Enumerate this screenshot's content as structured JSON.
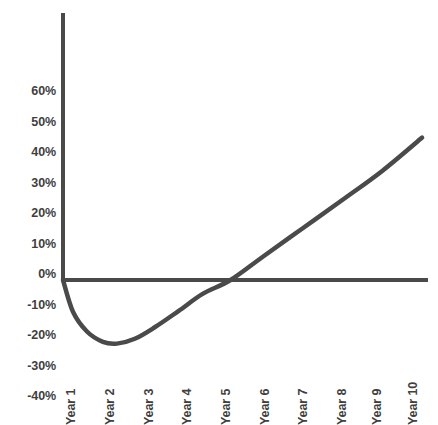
{
  "chart_data": {
    "type": "line",
    "title": "",
    "subtitle": "",
    "xlabel": "",
    "ylabel": "",
    "categories": [
      "Year 1",
      "Year 2",
      "Year 3",
      "Year 4",
      "Year 5",
      "Year 6",
      "Year 7",
      "Year 8",
      "Year 9",
      "Year 10"
    ],
    "series": [
      {
        "name": "Cumulative return",
        "values": [
          0,
          -20,
          -19,
          -8,
          5,
          15,
          23,
          31,
          39,
          47
        ]
      }
    ],
    "x": [
      1,
      2,
      3,
      4,
      5,
      6,
      7,
      8,
      9,
      10
    ],
    "y_tick_labels": [
      "60%",
      "50%",
      "40%",
      "30%",
      "20%",
      "10%",
      "0%",
      "-10%",
      "-20%",
      "-30%",
      "-40%"
    ],
    "y_tick_values": [
      60,
      50,
      40,
      30,
      20,
      10,
      0,
      -10,
      -20,
      -30,
      -40
    ],
    "ylim": [
      -40,
      68
    ],
    "xlim": [
      0.6,
      10.4
    ],
    "grid": false,
    "legend": false,
    "legend_position": "none",
    "annotations": {
      "minimum_value_pct": -21,
      "minimum_at_year": 2.3,
      "zero_crossing_year": 5.2,
      "final_value_pct": 47,
      "shape": "J-curve"
    },
    "curve_path_points": [
      {
        "year": 1.0,
        "value": 0
      },
      {
        "year": 1.25,
        "value": -10.5
      },
      {
        "year": 1.6,
        "value": -17.0
      },
      {
        "year": 2.0,
        "value": -20.4
      },
      {
        "year": 2.35,
        "value": -21.0
      },
      {
        "year": 2.8,
        "value": -19.4
      },
      {
        "year": 3.3,
        "value": -15.6
      },
      {
        "year": 3.9,
        "value": -10.2
      },
      {
        "year": 4.5,
        "value": -4.6
      },
      {
        "year": 5.2,
        "value": 0
      },
      {
        "year": 6.0,
        "value": 7.6
      },
      {
        "year": 7.0,
        "value": 17.0
      },
      {
        "year": 8.0,
        "value": 26.4
      },
      {
        "year": 9.0,
        "value": 36.0
      },
      {
        "year": 10.0,
        "value": 47.0
      }
    ]
  },
  "style": {
    "line_color": "#4a4a4a",
    "axis_color": "#4a4a4a",
    "text_color": "#3f3f3f",
    "background_color": "#ffffff",
    "line_width_px": 4
  }
}
